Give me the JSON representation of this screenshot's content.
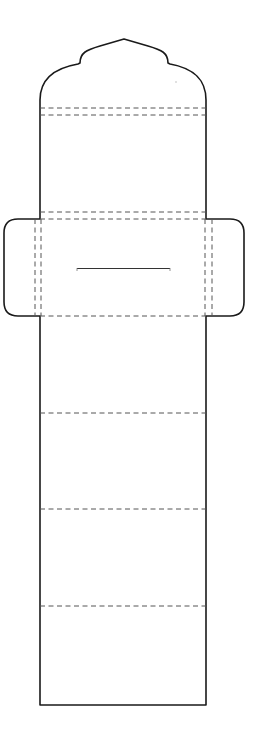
{
  "diagram": {
    "type": "die-cut template (tag / belly-band envelope)",
    "canvas": {
      "width": 253,
      "height": 738,
      "background": "#ffffff"
    },
    "colors": {
      "cut_line": "#1a1a1a",
      "fold_line": "#555555",
      "slit": "#333333"
    },
    "body": {
      "left_x": 40,
      "right_x": 206,
      "bottom_y": 705,
      "top_peak": {
        "x": 124,
        "y": 39
      }
    },
    "side_flaps": {
      "top_y": 219,
      "bottom_y": 316,
      "left_outer_x": 4,
      "right_outer_x": 244,
      "corner_radius": 14
    },
    "horizontal_fold_lines_y": [
      108,
      115,
      212,
      219,
      316,
      413,
      509,
      606
    ],
    "vertical_fold_lines_x": [
      35,
      41,
      205,
      212
    ],
    "slit": {
      "x1": 77,
      "x2": 170,
      "y": 269
    }
  }
}
